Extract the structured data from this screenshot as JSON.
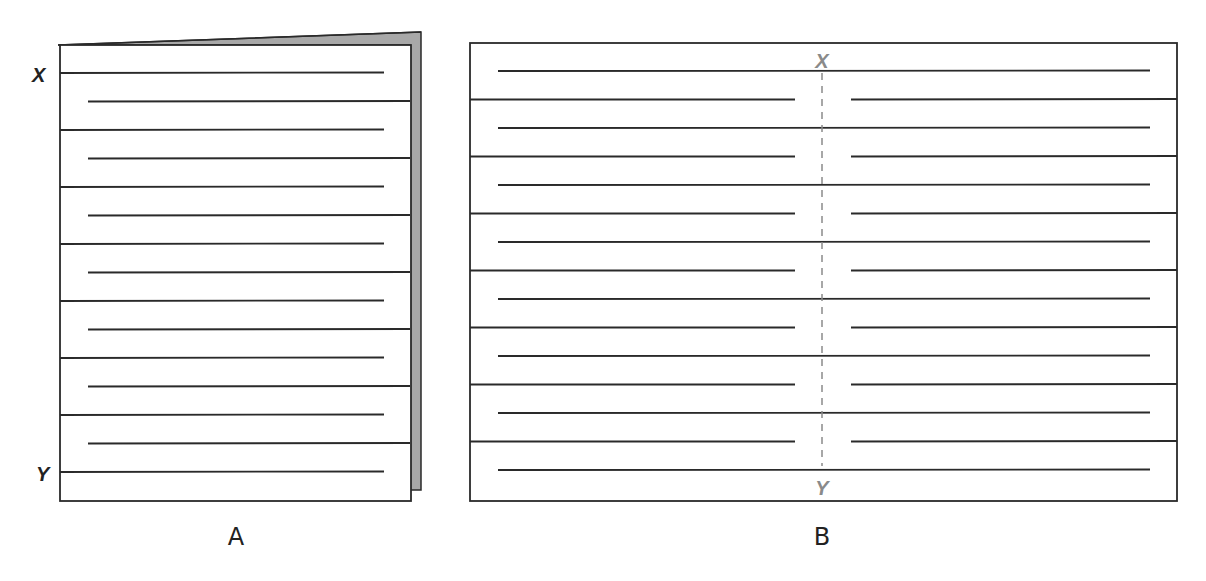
{
  "colors": {
    "line": "#2a2a2a",
    "page_fold": "#a8a8a8",
    "dashed_axis": "#8a8a8a",
    "background": "#ffffff"
  },
  "panel_a": {
    "caption": "A",
    "top_label": "X",
    "bottom_label": "Y",
    "description": "Folded booklet with zig-zag ruled lines",
    "line_count": 15
  },
  "panel_b": {
    "caption": "B",
    "top_label": "X",
    "bottom_label": "Y",
    "description": "Unfolded sheet with zig-zag lines and dashed fold axis from X to Y",
    "line_count": 15
  }
}
